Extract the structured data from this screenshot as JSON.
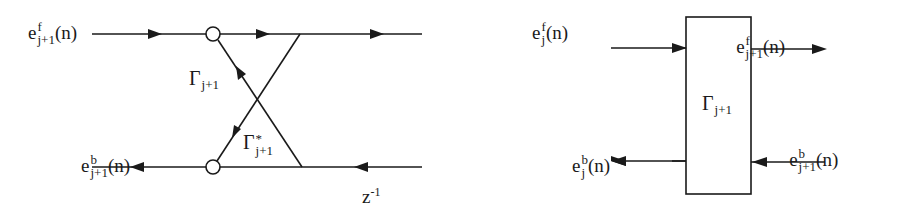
{
  "lattice_stage": {
    "inputs": {
      "forward_in": {
        "base": "e",
        "sup": "f",
        "sub": "j+1",
        "arg": "(n)"
      },
      "backward_out": {
        "base": "e",
        "sup": "b",
        "sub": "j+1",
        "arg": "(n)"
      }
    },
    "outputs": {
      "forward_out": {
        "base": "e",
        "sup": "f",
        "sub": "j",
        "arg": "(n)"
      },
      "backward_in": {
        "base": "e",
        "sup": "b",
        "sub": "j",
        "arg": "(n)"
      }
    },
    "coefficients": {
      "gamma": {
        "symbol": "Γ",
        "sup": "",
        "sub": "j+1"
      },
      "gamma_conj": {
        "symbol": "Γ",
        "sup": "*",
        "sub": "j+1"
      }
    },
    "delay": {
      "base": "z",
      "exp": "-1"
    }
  },
  "block_stage": {
    "inputs": {
      "forward_in": {
        "base": "e",
        "sup": "f",
        "sub": "j+1",
        "arg": "(n)"
      },
      "backward_out": {
        "base": "e",
        "sup": "b",
        "sub": "j+1",
        "arg": "(n)"
      }
    },
    "outputs": {
      "forward_out": {
        "base": "e",
        "sup": "f",
        "sub": "j",
        "arg": "(n)"
      },
      "backward_in": {
        "base": "e",
        "sup": "b",
        "sub": "j",
        "arg": "(n)"
      }
    },
    "box_label": {
      "symbol": "Γ",
      "sub": "j+1"
    }
  },
  "colors": {
    "stroke": "#1a1a1a",
    "background": "#ffffff"
  }
}
